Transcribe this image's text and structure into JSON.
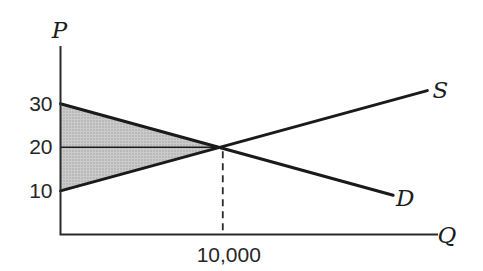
{
  "chart_data": {
    "type": "line",
    "title": "",
    "xlabel": "Q",
    "ylabel": "P",
    "xlim": [
      0,
      23200
    ],
    "ylim": [
      0,
      43
    ],
    "grid": false,
    "legend": "inline-end-labels",
    "x_ticks": [
      {
        "value": 10000,
        "label": "10,000"
      }
    ],
    "y_ticks": [
      {
        "value": 30,
        "label": "30"
      },
      {
        "value": 20,
        "label": "20"
      },
      {
        "value": 10,
        "label": "10"
      }
    ],
    "series": [
      {
        "name": "S",
        "role": "supply",
        "points": [
          [
            0,
            10
          ],
          [
            22600,
            33
          ]
        ]
      },
      {
        "name": "D",
        "role": "demand",
        "points": [
          [
            0,
            30
          ],
          [
            20500,
            9
          ]
        ]
      }
    ],
    "equilibrium": {
      "quantity": 10000,
      "price": 20
    },
    "shaded_region": {
      "description": "triangle between demand and supply curves left of equilibrium",
      "vertices": [
        [
          0,
          30
        ],
        [
          0,
          10
        ],
        [
          10000,
          20
        ]
      ]
    },
    "reference_lines": [
      {
        "orientation": "horizontal",
        "price": 20,
        "q_from": 0,
        "q_to": 10000,
        "style": "solid"
      },
      {
        "orientation": "vertical",
        "quantity": 10000,
        "p_from": 0,
        "p_to": 20,
        "style": "dashed"
      }
    ],
    "colors": {
      "line": "#1a1a1a",
      "shade_base": "#cbcbcb",
      "shade_dot": "#9a9a9a",
      "background": "#ffffff"
    }
  }
}
